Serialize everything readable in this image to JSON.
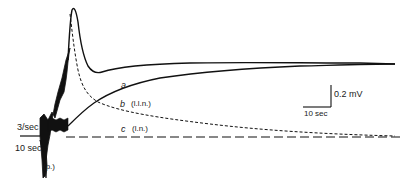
{
  "figure": {
    "type": "electrophysiology-trace",
    "traces": [
      {
        "id": "a",
        "label": "a",
        "style": "solid",
        "description": "recovery trace, returns to plateau"
      },
      {
        "id": "b",
        "label": "b",
        "annotation": "(l.l.n.)",
        "style": "solid"
      },
      {
        "id": "c",
        "label": "c",
        "annotation": "(l.n.)",
        "style": "dashed-short"
      }
    ],
    "baseline": {
      "style": "dashed-long"
    },
    "left_labels": {
      "rate": "3/sec",
      "duration": "10 sec",
      "phase": "(p.)"
    },
    "scale_bar": {
      "vertical": "0.2 mV",
      "horizontal": "10 sec"
    }
  }
}
